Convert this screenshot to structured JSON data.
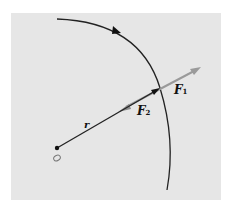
{
  "diagram": {
    "labels": {
      "r": "r",
      "F1_main": "F",
      "F1_sub": "1",
      "F2_main": "F",
      "F2_sub": "2",
      "origin": "O"
    },
    "colors": {
      "background": "#e6e6e6",
      "arc": "#222222",
      "radius": "#222222",
      "force_vector": "#9a9a9a"
    }
  }
}
